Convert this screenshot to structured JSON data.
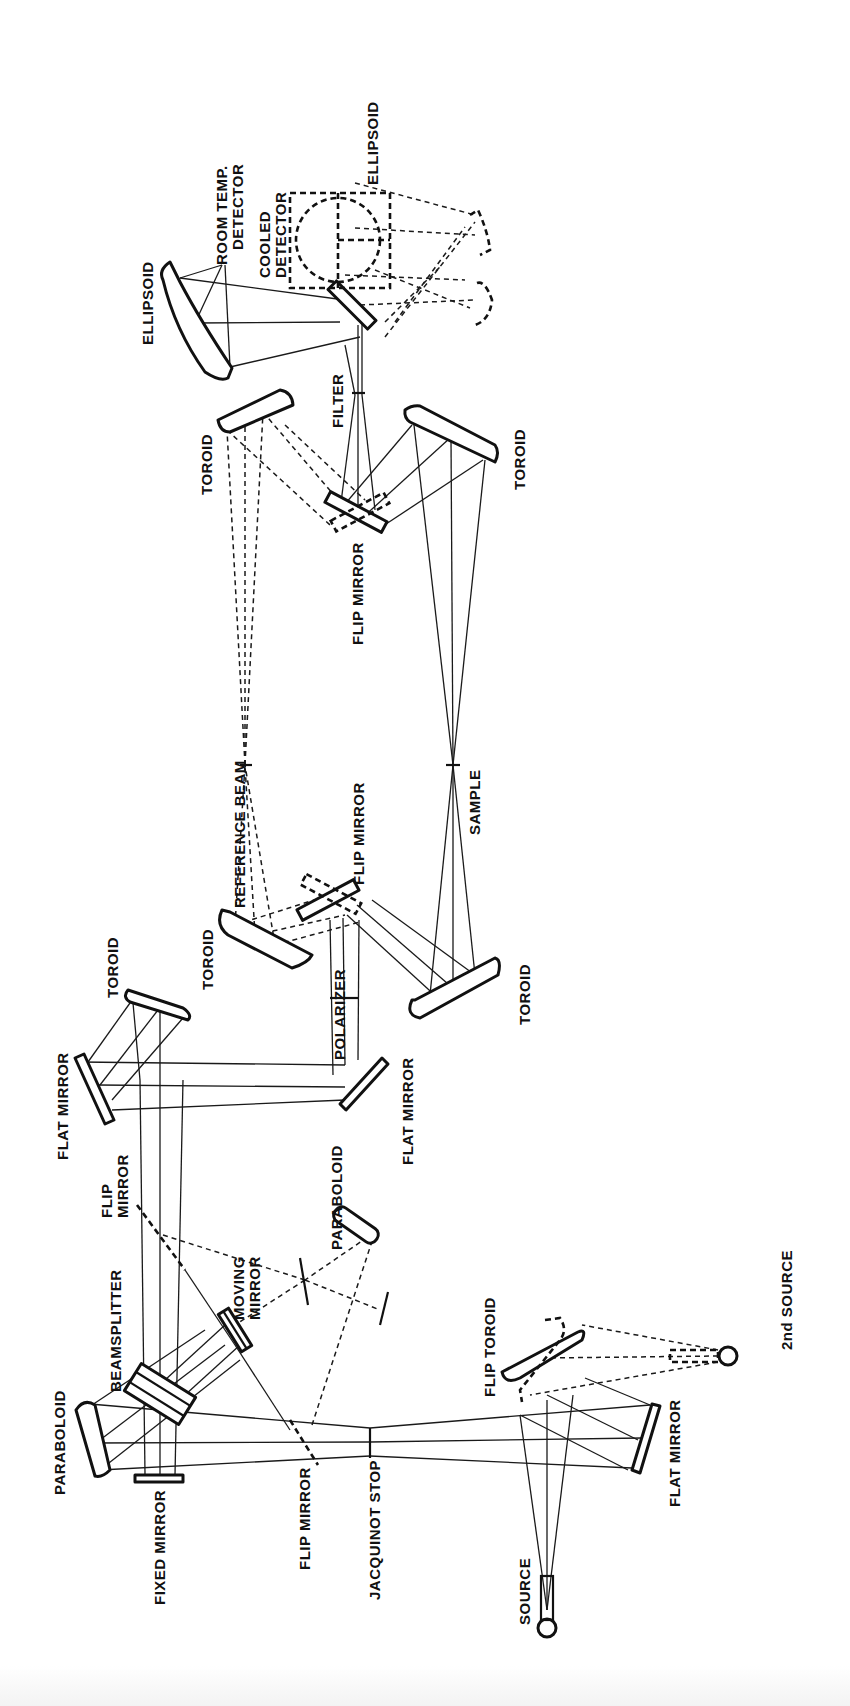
{
  "diagram": {
    "type": "optical-layout",
    "orientation": "rotated-90-ccw",
    "labels": {
      "source": "SOURCE",
      "second_source": "2nd SOURCE",
      "flat_mirror_source": "FLAT MIRROR",
      "flip_toroid": "FLIP TOROID",
      "jacquinot_stop": "JACQUINOT STOP",
      "flip_mirror_input": "FLIP MIRROR",
      "fixed_mirror": "FIXED MIRROR",
      "paraboloid_collimator": "PARABOLOID",
      "beamsplitter": "BEAMSPLITTER",
      "moving_mirror_line1": "MOVING",
      "moving_mirror_line2": "MIRROR",
      "flip_mirror_upper_line1": "FLIP",
      "flip_mirror_upper_line2": "MIRROR",
      "paraboloid_laser": "PARABOLOID",
      "flat_mirror_left": "FLAT MIRROR",
      "flat_mirror_right": "FLAT MIRROR",
      "toroid_1": "TOROID",
      "polarizer": "POLARIZER",
      "toroid_ref_in": "TOROID",
      "flip_mirror_mid": "FLIP MIRROR",
      "toroid_sample_in": "TOROID",
      "reference_beam": "REFERENCE BEAM",
      "sample": "SAMPLE",
      "toroid_ref_out": "TOROID",
      "toroid_sample_out": "TOROID",
      "flip_mirror_out": "FLIP MIRROR",
      "filter": "FILTER",
      "ellipsoid_room": "ELLIPSOID",
      "room_temp_detector_line1": "ROOM TEMP.",
      "room_temp_detector_line2": "DETECTOR",
      "cooled_detector_line1": "COOLED",
      "cooled_detector_line2": "DETECTOR",
      "ellipsoid_cooled": "ELLIPSOID"
    },
    "legend": {
      "solid_line": "primary beam path",
      "dashed_line": "alternate / switched beam path"
    },
    "colors": {
      "ink": "#111111",
      "background": "#ffffff"
    }
  }
}
